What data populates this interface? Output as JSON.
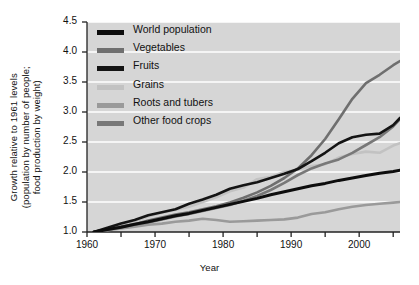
{
  "chart_data": {
    "type": "line",
    "title": "",
    "xlabel": "Year",
    "ylabel": "Growth relative to 1961 levels (population by number of people; food production by weight)",
    "ylabel_lines": [
      "Growth relative to 1961 levels",
      "(population by number of people;",
      "food production by weight)"
    ],
    "xlim": [
      1960,
      2006
    ],
    "ylim": [
      1.0,
      4.5
    ],
    "xticks": [
      1960,
      1970,
      1980,
      1990,
      2000
    ],
    "xticks_labels": [
      "1960",
      "1970",
      "1980",
      "1990",
      "2000"
    ],
    "xminor_ticks": [
      1965,
      1975,
      1985,
      1995,
      2005
    ],
    "yticks": [
      1.0,
      1.5,
      2.0,
      2.5,
      3.0,
      3.5,
      4.0,
      4.5
    ],
    "ytick_labels": [
      "1.0",
      "1.5",
      "2.0",
      "2.5",
      "3.0",
      "3.5",
      "4.0",
      "4.5"
    ],
    "grid": "horizontal-white",
    "plot_background": "#d6d6d6",
    "legend_position": "top-left-inside",
    "series": [
      {
        "name": "World population",
        "color": "#0d0d0d",
        "width": 3.0,
        "x": [
          1961,
          1963,
          1965,
          1967,
          1969,
          1971,
          1973,
          1975,
          1977,
          1979,
          1981,
          1983,
          1985,
          1987,
          1989,
          1991,
          1993,
          1995,
          1997,
          1999,
          2001,
          2003,
          2005,
          2006
        ],
        "values": [
          1.0,
          1.04,
          1.08,
          1.13,
          1.17,
          1.22,
          1.27,
          1.31,
          1.36,
          1.41,
          1.46,
          1.51,
          1.56,
          1.62,
          1.67,
          1.72,
          1.77,
          1.81,
          1.86,
          1.9,
          1.94,
          1.98,
          2.01,
          2.03
        ]
      },
      {
        "name": "Vegetables",
        "color": "#6f6f6f",
        "width": 2.6,
        "x": [
          1961,
          1963,
          1965,
          1967,
          1969,
          1971,
          1973,
          1975,
          1977,
          1979,
          1981,
          1983,
          1985,
          1987,
          1989,
          1991,
          1993,
          1995,
          1997,
          1999,
          2001,
          2003,
          2005,
          2006
        ],
        "values": [
          1.0,
          1.04,
          1.09,
          1.13,
          1.19,
          1.24,
          1.29,
          1.33,
          1.38,
          1.43,
          1.49,
          1.57,
          1.66,
          1.77,
          1.9,
          2.06,
          2.28,
          2.55,
          2.88,
          3.22,
          3.48,
          3.62,
          3.78,
          3.85
        ]
      },
      {
        "name": "Fruits",
        "color": "#141414",
        "width": 2.6,
        "x": [
          1961,
          1963,
          1965,
          1967,
          1969,
          1971,
          1973,
          1975,
          1977,
          1979,
          1981,
          1983,
          1985,
          1987,
          1989,
          1991,
          1993,
          1995,
          1997,
          1999,
          2001,
          2003,
          2005,
          2006
        ],
        "values": [
          1.0,
          1.07,
          1.14,
          1.2,
          1.28,
          1.33,
          1.38,
          1.47,
          1.54,
          1.62,
          1.72,
          1.78,
          1.83,
          1.9,
          1.97,
          2.05,
          2.18,
          2.32,
          2.48,
          2.58,
          2.62,
          2.64,
          2.78,
          2.9
        ]
      },
      {
        "name": "Grains",
        "color": "#c2c2c2",
        "width": 2.6,
        "x": [
          1961,
          1963,
          1965,
          1967,
          1969,
          1971,
          1973,
          1975,
          1977,
          1979,
          1981,
          1983,
          1985,
          1987,
          1989,
          1991,
          1993,
          1995,
          1997,
          1999,
          2001,
          2003,
          2005,
          2006
        ],
        "values": [
          1.0,
          1.05,
          1.1,
          1.18,
          1.26,
          1.32,
          1.37,
          1.42,
          1.5,
          1.58,
          1.68,
          1.74,
          1.88,
          1.92,
          2.0,
          2.04,
          2.1,
          2.13,
          2.24,
          2.3,
          2.34,
          2.32,
          2.44,
          2.48
        ]
      },
      {
        "name": "Roots and tubers",
        "color": "#9a9a9a",
        "width": 2.6,
        "x": [
          1961,
          1963,
          1965,
          1967,
          1969,
          1971,
          1973,
          1975,
          1977,
          1979,
          1981,
          1983,
          1985,
          1987,
          1989,
          1991,
          1993,
          1995,
          1997,
          1999,
          2001,
          2003,
          2005,
          2006
        ],
        "values": [
          1.0,
          1.03,
          1.06,
          1.09,
          1.12,
          1.14,
          1.17,
          1.19,
          1.22,
          1.2,
          1.17,
          1.18,
          1.19,
          1.2,
          1.21,
          1.24,
          1.3,
          1.33,
          1.38,
          1.42,
          1.45,
          1.47,
          1.49,
          1.5
        ]
      },
      {
        "name": "Other food crops",
        "color": "#787878",
        "width": 2.6,
        "x": [
          1961,
          1963,
          1965,
          1967,
          1969,
          1971,
          1973,
          1975,
          1977,
          1979,
          1981,
          1983,
          1985,
          1987,
          1989,
          1991,
          1993,
          1995,
          1997,
          1999,
          2001,
          2003,
          2005,
          2006
        ],
        "values": [
          1.0,
          1.04,
          1.08,
          1.12,
          1.16,
          1.21,
          1.26,
          1.3,
          1.35,
          1.4,
          1.45,
          1.52,
          1.6,
          1.7,
          1.82,
          1.95,
          2.06,
          2.14,
          2.21,
          2.32,
          2.45,
          2.58,
          2.76,
          2.88
        ]
      }
    ],
    "legend": [
      {
        "label": "World population",
        "color": "#0d0d0d"
      },
      {
        "label": "Vegetables",
        "color": "#6f6f6f"
      },
      {
        "label": "Fruits",
        "color": "#141414"
      },
      {
        "label": "Grains",
        "color": "#c2c2c2"
      },
      {
        "label": "Roots and tubers",
        "color": "#9a9a9a"
      },
      {
        "label": "Other food crops",
        "color": "#787878"
      }
    ]
  }
}
